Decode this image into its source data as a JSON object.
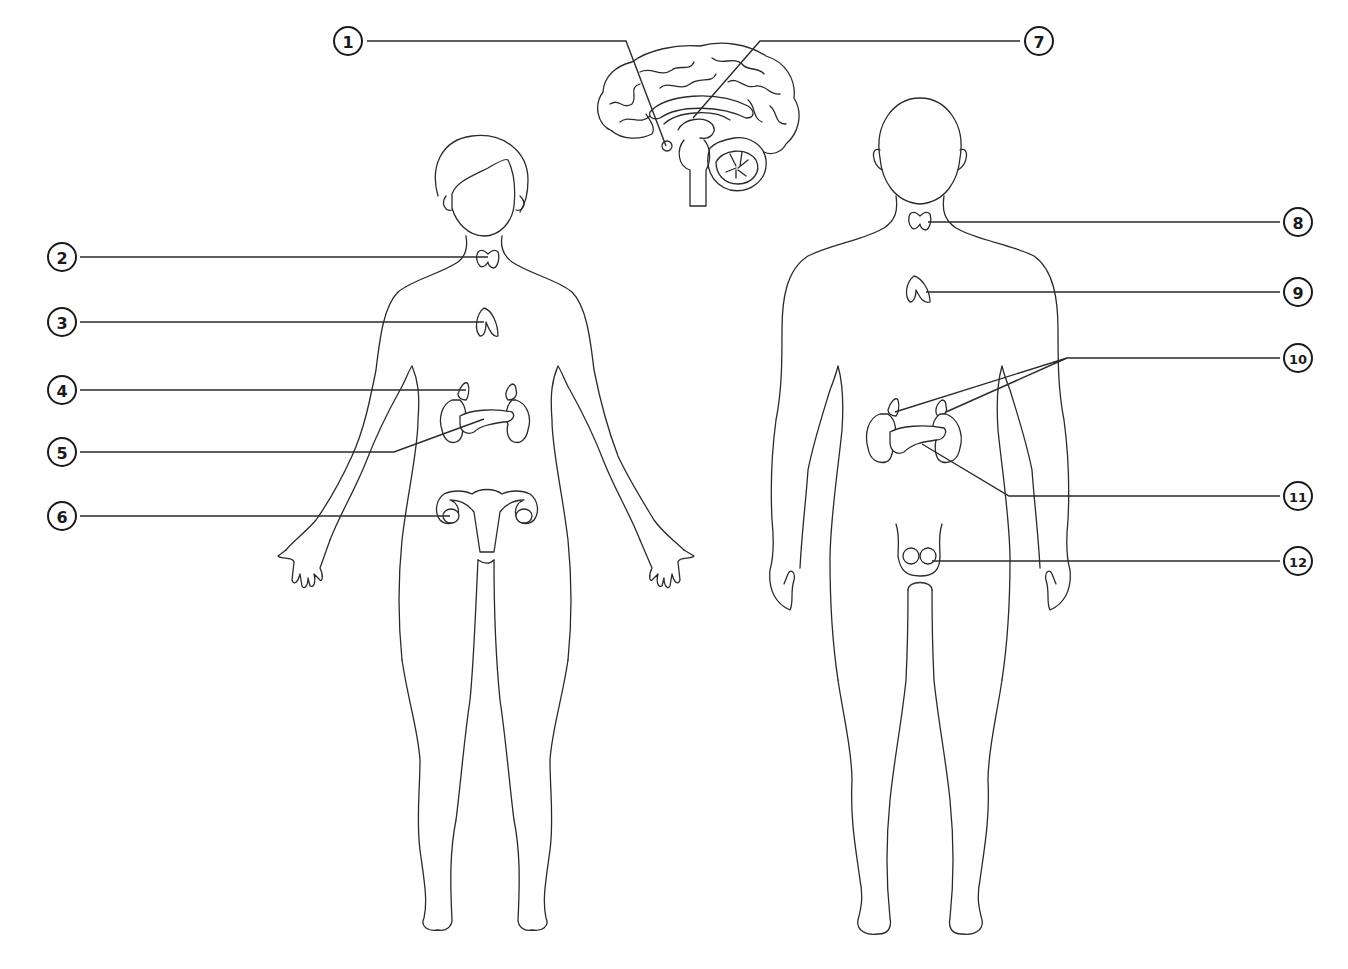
{
  "diagram": {
    "title": "",
    "background": "#ffffff",
    "line_color": "#2a2a2a",
    "figures": [
      "brain-sagittal-section",
      "female-body",
      "male-body"
    ],
    "callouts": [
      {
        "number": "1",
        "side": "left",
        "badge": [
          348,
          41
        ],
        "path": "M367,41 L626,41 L666,146"
      },
      {
        "number": "2",
        "side": "left",
        "badge": [
          62,
          257
        ],
        "path": "M80,257 L488,257"
      },
      {
        "number": "3",
        "side": "left",
        "badge": [
          62,
          322
        ],
        "path": "M80,322 L484,322"
      },
      {
        "number": "4",
        "side": "left",
        "badge": [
          62,
          390
        ],
        "path": "M80,390 L466,390"
      },
      {
        "number": "5",
        "side": "left",
        "badge": [
          62,
          452
        ],
        "path": "M80,452 L394,452 L484,419"
      },
      {
        "number": "6",
        "side": "left",
        "badge": [
          62,
          516
        ],
        "path": "M80,516 L450,516"
      },
      {
        "number": "7",
        "side": "right",
        "badge": [
          1039,
          41
        ],
        "path": "M1020,41 L760,41 L693,118"
      },
      {
        "number": "8",
        "side": "right",
        "badge": [
          1298,
          222
        ],
        "path": "M1280,222 L928,222"
      },
      {
        "number": "9",
        "side": "right",
        "badge": [
          1298,
          292
        ],
        "path": "M1280,292 L926,292"
      },
      {
        "number": "10",
        "side": "right",
        "badge": [
          1298,
          358
        ],
        "path": "M1280,358 L1067,358 L895,412 M1067,358 L946,412"
      },
      {
        "number": "11",
        "side": "right",
        "badge": [
          1298,
          496
        ],
        "path": "M1280,496 L1009,496 L922,444"
      },
      {
        "number": "12",
        "side": "right",
        "badge": [
          1298,
          561
        ],
        "path": "M1280,561 L932,561"
      }
    ]
  }
}
